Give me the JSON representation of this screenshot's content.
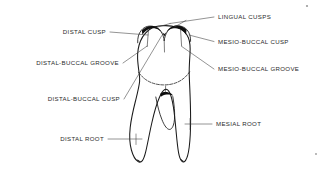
{
  "diagram": {
    "background_color": "#ffffff",
    "line_color": "#1a1a1a",
    "text_color": "#2b2b2b",
    "labels": {
      "distal_cusp": "DISTAL CUSP",
      "distal_buccal_groove": "DISTAL-BUCCAL GROOVE",
      "distal_buccal_cusp": "DISTAL-BUCCAL CUSP",
      "distal_root": "DISTAL ROOT",
      "lingual_cusps": "LINGUAL CUSPS",
      "mesio_buccal_cusp": "MESIO-BUCCAL CUSP",
      "mesio_buccal_groove": "MESIO-BUCCAL GROOVE",
      "mesial_root": "MESIAL ROOT"
    }
  }
}
